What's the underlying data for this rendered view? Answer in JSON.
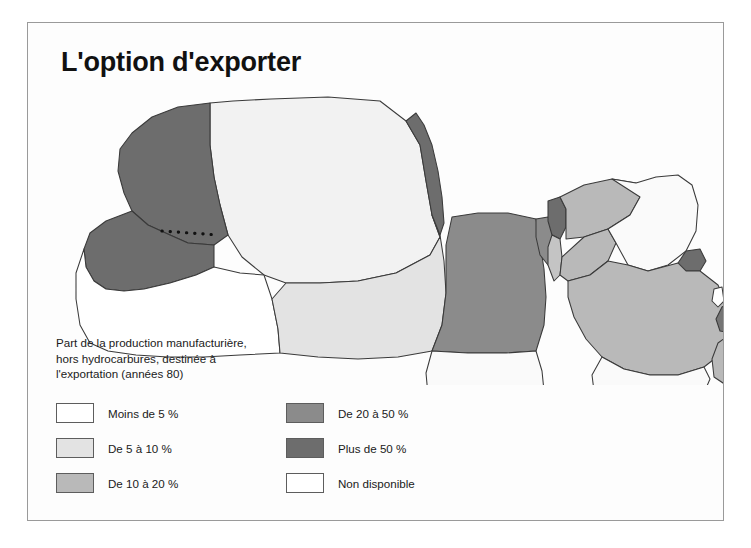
{
  "figure": {
    "title": "L'option d'exporter",
    "frame_color": "#9a9a9a",
    "background": "#fdfdfd"
  },
  "legend": {
    "caption": "Part de la production manufacturière,\nhors hydrocarbures, destinée à\nl'exportation (années 80)",
    "columns": [
      {
        "items": [
          {
            "label": "Moins de 5 %",
            "color": "#ffffff"
          },
          {
            "label": "De 5 à 10 %",
            "color": "#e3e3e3"
          },
          {
            "label": "De 10 à 20 %",
            "color": "#b9b9b9"
          }
        ]
      },
      {
        "items": [
          {
            "label": "De 20 à 50 %",
            "color": "#8b8b8b"
          },
          {
            "label": "Plus de 50 %",
            "color": "#6d6d6d"
          },
          {
            "label": "Non disponible",
            "color": "#ffffff"
          }
        ]
      }
    ]
  },
  "map": {
    "boundary_stroke": "#3a3a3a",
    "disputed_border_note": "dotted line across Morocco / Western Sahara",
    "regions": [
      {
        "name": "morocco",
        "category": "Plus de 50 %",
        "color": "#6d6d6d"
      },
      {
        "name": "western-sahara",
        "category": "Plus de 50 %",
        "color": "#6d6d6d"
      },
      {
        "name": "mauritania",
        "category": "Non disponible",
        "color": "#ffffff"
      },
      {
        "name": "algeria",
        "category": "De 5 à 10 %",
        "color": "#f2f2f2"
      },
      {
        "name": "tunisia",
        "category": "Plus de 50 %",
        "color": "#6d6d6d"
      },
      {
        "name": "libya",
        "category": "De 5 à 10 %",
        "color": "#e3e3e3"
      },
      {
        "name": "egypt",
        "category": "De 20 à 50 %",
        "color": "#8b8b8b"
      },
      {
        "name": "sudan",
        "category": "Non disponible",
        "color": "#fafafa"
      },
      {
        "name": "lebanon",
        "category": "Plus de 50 %",
        "color": "#6d6d6d"
      },
      {
        "name": "syria",
        "category": "De 10 à 20 %",
        "color": "#b9b9b9"
      },
      {
        "name": "israel-palestine",
        "category": "De 10 à 20 %",
        "color": "#c4c4c4"
      },
      {
        "name": "jordan",
        "category": "De 10 à 20 %",
        "color": "#b9b9b9"
      },
      {
        "name": "iraq",
        "category": "Non disponible",
        "color": "#fafafa"
      },
      {
        "name": "kuwait",
        "category": "Plus de 50 %",
        "color": "#6d6d6d"
      },
      {
        "name": "saudi-arabia",
        "category": "De 10 à 20 %",
        "color": "#b9b9b9"
      },
      {
        "name": "qatar",
        "category": "Non disponible",
        "color": "#ffffff"
      },
      {
        "name": "uae",
        "category": "Plus de 50 %",
        "color": "#757575"
      },
      {
        "name": "oman",
        "category": "De 10 à 20 %",
        "color": "#b9b9b9"
      },
      {
        "name": "yemen",
        "category": "Non disponible",
        "color": "#fafafa"
      },
      {
        "name": "djibouti",
        "category": "Non disponible",
        "color": "#fafafa"
      },
      {
        "name": "somalia",
        "category": "Non disponible",
        "color": "#fafafa"
      }
    ]
  }
}
